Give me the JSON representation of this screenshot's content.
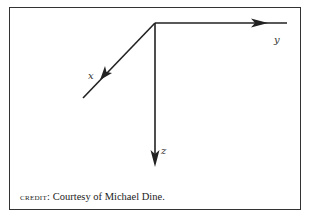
{
  "axes": {
    "x_label": "x",
    "y_label": "y",
    "z_label": "z"
  },
  "credit": {
    "prefix": "credit:",
    "text": " Courtesy of Michael Dine."
  }
}
